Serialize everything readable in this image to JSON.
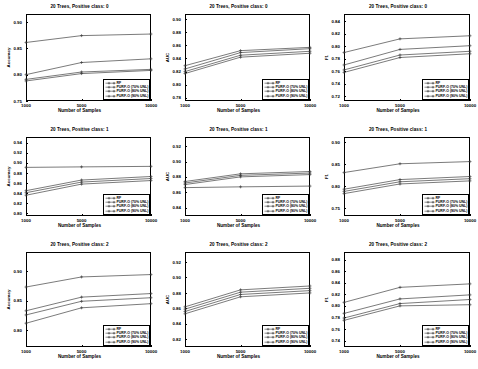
{
  "figure": {
    "rows": 3,
    "cols": 3,
    "xlabel": "Number of Samples",
    "xticks": [
      "1000",
      "5000",
      "10000"
    ],
    "x_values": [
      1000,
      5000,
      10000
    ],
    "series_names": [
      "RF",
      "PURF-O (70% UNL)",
      "PURF-O (80% UNL)",
      "PURF-O (90% UNL)"
    ],
    "line_color": "#333333"
  },
  "chart_data": [
    {
      "type": "line",
      "title": "20 Trees, Positive class: 0",
      "xlabel": "Number of Samples",
      "ylabel": "Accuracy",
      "x": [
        1000,
        5000,
        10000
      ],
      "ylim": [
        0.75,
        0.915
      ],
      "yticks": [
        0.75,
        0.8,
        0.85,
        0.9
      ],
      "ytick_labels": [
        "0.75",
        "0.80",
        "0.85",
        "0.90"
      ],
      "grid": false,
      "legend_position": "lower right",
      "series": [
        {
          "name": "RF",
          "values": [
            0.861,
            0.874,
            0.877
          ]
        },
        {
          "name": "PURF-O (70% UNL)",
          "values": [
            0.8,
            0.823,
            0.83
          ]
        },
        {
          "name": "PURF-O (80% UNL)",
          "values": [
            0.791,
            0.805,
            0.81
          ]
        },
        {
          "name": "PURF-O (90% UNL)",
          "values": [
            0.788,
            0.802,
            0.808
          ]
        }
      ]
    },
    {
      "type": "line",
      "title": "20 Trees, Positive class: 0",
      "xlabel": "Number of Samples",
      "ylabel": "AUC",
      "x": [
        1000,
        5000,
        10000
      ],
      "ylim": [
        0.775,
        0.908
      ],
      "yticks": [
        0.78,
        0.8,
        0.82,
        0.84,
        0.86,
        0.88,
        0.9
      ],
      "ytick_labels": [
        "0.78",
        "0.80",
        "0.82",
        "0.84",
        "0.86",
        "0.88",
        "0.90"
      ],
      "grid": false,
      "legend_position": "lower right",
      "series": [
        {
          "name": "RF",
          "values": [
            0.829,
            0.852,
            0.857
          ]
        },
        {
          "name": "PURF-O (70% UNL)",
          "values": [
            0.824,
            0.849,
            0.855
          ]
        },
        {
          "name": "PURF-O (80% UNL)",
          "values": [
            0.82,
            0.845,
            0.851
          ]
        },
        {
          "name": "PURF-O (90% UNL)",
          "values": [
            0.817,
            0.842,
            0.848
          ]
        }
      ]
    },
    {
      "type": "line",
      "title": "20 Trees, Positive class: 0",
      "xlabel": "Number of Samples",
      "ylabel": "F1",
      "x": [
        1000,
        5000,
        10000
      ],
      "ylim": [
        0.712,
        0.852
      ],
      "yticks": [
        0.72,
        0.74,
        0.76,
        0.78,
        0.8,
        0.82,
        0.84
      ],
      "ytick_labels": [
        "0.72",
        "0.74",
        "0.76",
        "0.78",
        "0.80",
        "0.82",
        "0.84"
      ],
      "grid": false,
      "legend_position": "lower right",
      "series": [
        {
          "name": "RF",
          "values": [
            0.79,
            0.812,
            0.817
          ]
        },
        {
          "name": "PURF-O (70% UNL)",
          "values": [
            0.77,
            0.795,
            0.801
          ]
        },
        {
          "name": "PURF-O (80% UNL)",
          "values": [
            0.762,
            0.786,
            0.792
          ]
        },
        {
          "name": "PURF-O (90% UNL)",
          "values": [
            0.758,
            0.782,
            0.788
          ]
        }
      ]
    },
    {
      "type": "line",
      "title": "20 Trees, Positive class: 1",
      "xlabel": "Number of Samples",
      "ylabel": "Accuracy",
      "x": [
        1000,
        5000,
        10000
      ],
      "ylim": [
        0.795,
        0.951
      ],
      "yticks": [
        0.8,
        0.82,
        0.84,
        0.86,
        0.88,
        0.9,
        0.92,
        0.94
      ],
      "ytick_labels": [
        "0.80",
        "0.82",
        "0.84",
        "0.86",
        "0.88",
        "0.90",
        "0.92",
        "0.94"
      ],
      "grid": false,
      "legend_position": "lower right",
      "series": [
        {
          "name": "RF",
          "values": [
            0.891,
            0.892,
            0.893
          ]
        },
        {
          "name": "PURF-O (70% UNL)",
          "values": [
            0.845,
            0.866,
            0.873
          ]
        },
        {
          "name": "PURF-O (80% UNL)",
          "values": [
            0.841,
            0.862,
            0.869
          ]
        },
        {
          "name": "PURF-O (90% UNL)",
          "values": [
            0.836,
            0.858,
            0.865
          ]
        }
      ]
    },
    {
      "type": "line",
      "title": "20 Trees, Positive class: 1",
      "xlabel": "Number of Samples",
      "ylabel": "AUC",
      "x": [
        1000,
        5000,
        10000
      ],
      "ylim": [
        0.829,
        0.932
      ],
      "yticks": [
        0.84,
        0.86,
        0.88,
        0.9,
        0.92
      ],
      "ytick_labels": [
        "0.84",
        "0.86",
        "0.88",
        "0.90",
        "0.92"
      ],
      "grid": false,
      "legend_position": "lower right",
      "series": [
        {
          "name": "RF",
          "values": [
            0.874,
            0.884,
            0.887
          ]
        },
        {
          "name": "PURF-O (70% UNL)",
          "values": [
            0.872,
            0.882,
            0.885
          ]
        },
        {
          "name": "PURF-O (80% UNL)",
          "values": [
            0.87,
            0.88,
            0.883
          ]
        },
        {
          "name": "PURF-O (90% UNL)",
          "values": [
            0.866,
            0.867,
            0.868
          ]
        }
      ]
    },
    {
      "type": "line",
      "title": "20 Trees, Positive class: 1",
      "xlabel": "Number of Samples",
      "ylabel": "F1",
      "x": [
        1000,
        5000,
        10000
      ],
      "ylim": [
        0.732,
        0.912
      ],
      "yticks": [
        0.75,
        0.8,
        0.85,
        0.9
      ],
      "ytick_labels": [
        "0.75",
        "0.80",
        "0.85",
        "0.90"
      ],
      "grid": false,
      "legend_position": "lower right",
      "series": [
        {
          "name": "RF",
          "values": [
            0.831,
            0.851,
            0.856
          ]
        },
        {
          "name": "PURF-O (70% UNL)",
          "values": [
            0.793,
            0.815,
            0.822
          ]
        },
        {
          "name": "PURF-O (80% UNL)",
          "values": [
            0.788,
            0.81,
            0.817
          ]
        },
        {
          "name": "PURF-O (90% UNL)",
          "values": [
            0.783,
            0.805,
            0.812
          ]
        }
      ]
    },
    {
      "type": "line",
      "title": "20 Trees, Positive class: 2",
      "xlabel": "Number of Samples",
      "ylabel": "Accuracy",
      "x": [
        1000,
        5000,
        10000
      ],
      "ylim": [
        0.772,
        0.932
      ],
      "yticks": [
        0.8,
        0.85,
        0.9
      ],
      "ytick_labels": [
        "0.80",
        "0.85",
        "0.90"
      ],
      "grid": false,
      "legend_position": "lower right",
      "series": [
        {
          "name": "RF",
          "values": [
            0.873,
            0.89,
            0.894
          ]
        },
        {
          "name": "PURF-O (70% UNL)",
          "values": [
            0.833,
            0.856,
            0.862
          ]
        },
        {
          "name": "PURF-O (80% UNL)",
          "values": [
            0.826,
            0.849,
            0.855
          ]
        },
        {
          "name": "PURF-O (90% UNL)",
          "values": [
            0.812,
            0.838,
            0.845
          ]
        }
      ]
    },
    {
      "type": "line",
      "title": "20 Trees, Positive class: 2",
      "xlabel": "Number of Samples",
      "ylabel": "AUC",
      "x": [
        1000,
        5000,
        10000
      ],
      "ylim": [
        0.81,
        0.933
      ],
      "yticks": [
        0.82,
        0.84,
        0.86,
        0.88,
        0.9,
        0.92
      ],
      "ytick_labels": [
        "0.82",
        "0.84",
        "0.86",
        "0.88",
        "0.90",
        "0.92"
      ],
      "grid": false,
      "legend_position": "lower right",
      "series": [
        {
          "name": "RF",
          "values": [
            0.862,
            0.884,
            0.889
          ]
        },
        {
          "name": "PURF-O (70% UNL)",
          "values": [
            0.859,
            0.881,
            0.886
          ]
        },
        {
          "name": "PURF-O (80% UNL)",
          "values": [
            0.856,
            0.878,
            0.883
          ]
        },
        {
          "name": "PURF-O (90% UNL)",
          "values": [
            0.853,
            0.875,
            0.88
          ]
        }
      ]
    },
    {
      "type": "line",
      "title": "20 Trees, Positive class: 2",
      "xlabel": "Number of Samples",
      "ylabel": "F1",
      "x": [
        1000,
        5000,
        10000
      ],
      "ylim": [
        0.729,
        0.893
      ],
      "yticks": [
        0.74,
        0.76,
        0.78,
        0.8,
        0.82,
        0.84,
        0.86,
        0.88
      ],
      "ytick_labels": [
        "0.74",
        "0.76",
        "0.78",
        "0.80",
        "0.82",
        "0.84",
        "0.86",
        "0.88"
      ],
      "grid": false,
      "legend_position": "lower right",
      "series": [
        {
          "name": "RF",
          "values": [
            0.806,
            0.832,
            0.838
          ]
        },
        {
          "name": "PURF-O (70% UNL)",
          "values": [
            0.787,
            0.812,
            0.819
          ]
        },
        {
          "name": "PURF-O (80% UNL)",
          "values": [
            0.779,
            0.804,
            0.811
          ]
        },
        {
          "name": "PURF-O (90% UNL)",
          "values": [
            0.775,
            0.8,
            0.802
          ]
        }
      ]
    }
  ]
}
